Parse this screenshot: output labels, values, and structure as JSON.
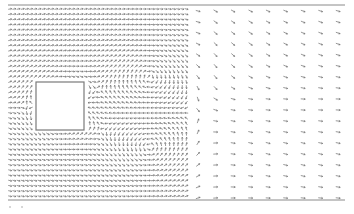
{
  "chart_data": {
    "type": "quiver",
    "title": "",
    "xlabel": "",
    "ylabel": "",
    "grid": false,
    "legend": null,
    "domain_px": {
      "x": [
        8,
        345
      ],
      "y": [
        5,
        200
      ]
    },
    "walls": [
      {
        "name": "top-wall",
        "y": 5,
        "x": [
          8,
          345
        ]
      },
      {
        "name": "bottom-wall",
        "y": 200,
        "x": [
          8,
          345
        ]
      }
    ],
    "obstacle": {
      "shape": "square",
      "x": 36,
      "y": 82,
      "width": 48,
      "height": 48
    },
    "dense_region": {
      "x": [
        10,
        190
      ],
      "dx": 4.2,
      "dy": 5.2
    },
    "coarse_region": {
      "x": [
        190,
        345
      ],
      "dx": 17.5,
      "dy": 11
    },
    "arrow_color": "#6b6b6b",
    "wall_color": "#8a8a8a",
    "obstacle_edge_color": "#7a7a7a",
    "ticks": [
      {
        "x": 10,
        "y": 206
      },
      {
        "x": 22,
        "y": 206
      }
    ]
  }
}
